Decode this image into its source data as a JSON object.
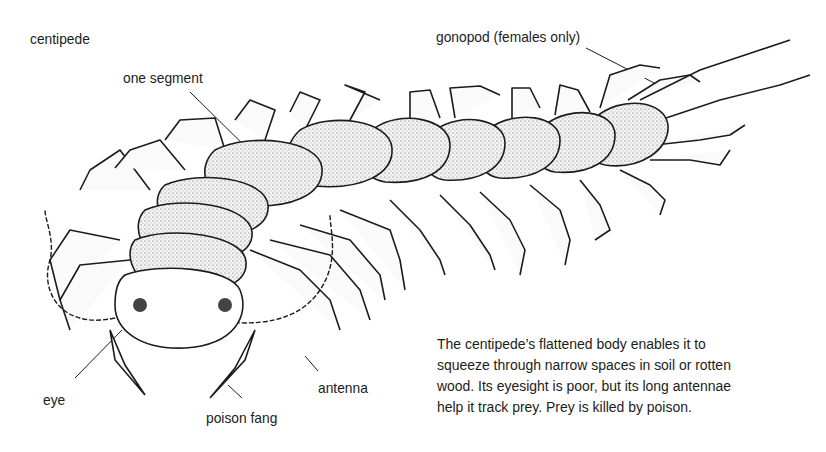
{
  "title": "centipede",
  "labels": {
    "one_segment": "one segment",
    "gonopod": "gonopod (females only)",
    "eye": "eye",
    "poison_fang": "poison fang",
    "antenna": "antenna"
  },
  "caption": {
    "lines": [
      "The centipede’s flattened body enables it to",
      "squeeze through narrow spaces in soil or rotten",
      "wood. Its eyesight is poor, but its long antennae",
      "help it track prey. Prey is killed by poison."
    ]
  },
  "colors": {
    "ink": "#1c1c1c",
    "background": "#ffffff",
    "segment_fill": "#f2f2f2"
  }
}
